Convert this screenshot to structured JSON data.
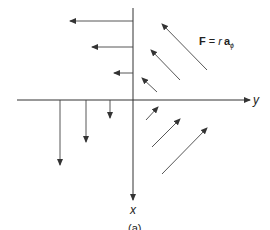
{
  "figure": {
    "equation_bold": "F",
    "equation_mid": " = ",
    "equation_r": "r",
    "equation_vec": "a",
    "equation_sub": "ϕ",
    "x_axis_label": "x",
    "y_axis_label": "y",
    "caption": "(a)"
  },
  "vector_field": {
    "description": "F = r a_phi, circulating field; arrow length grows with distance from origin",
    "quadrants": [
      {
        "name": "upper-left",
        "direction": "left",
        "magnitudes": [
          1,
          2,
          3
        ]
      },
      {
        "name": "lower-left",
        "direction": "down",
        "magnitudes": [
          1,
          2,
          3
        ]
      },
      {
        "name": "upper-right",
        "direction": "up-left",
        "magnitudes": [
          1,
          2,
          3
        ]
      },
      {
        "name": "lower-right",
        "direction": "up-right",
        "magnitudes": [
          1,
          2,
          3
        ]
      }
    ]
  },
  "colors": {
    "line": "#444444",
    "background": "#ffffff"
  }
}
